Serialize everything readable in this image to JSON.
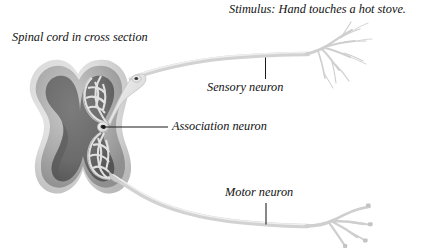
{
  "figure": {
    "kind": "anatomical-diagram",
    "background_color": "#ffffff",
    "width": 438,
    "height": 249
  },
  "labels": {
    "stimulus": "Stimulus: Hand touches a hot stove.",
    "spinal_cord": "Spinal cord in cross section",
    "sensory_neuron": "Sensory neuron",
    "association_neuron": "Association neuron",
    "motor_neuron": "Motor neuron"
  },
  "colors": {
    "text": "#111111",
    "leader_line": "#1a1a1a",
    "white_matter_outer": "#d9d9d9",
    "white_matter_mid": "#a9a9a9",
    "gray_matter": "#6e6e6e",
    "gray_matter_shadow": "#5d5d5d",
    "neuron_body": "#d6d6d6",
    "neuron_highlight": "#f1f1f1",
    "neuron_outline": "#bcbcbc",
    "ganglion_nucleus": "#3c3c3c",
    "axon": "#cfcfcf"
  },
  "structures": [
    {
      "name": "spinal-cord-cross-section",
      "description": "butterfly shaped gray matter within white matter"
    },
    {
      "name": "dorsal-root-ganglion",
      "description": "teardrop swelling with dark nucleus on sensory axon"
    },
    {
      "name": "sensory-neuron-cell-body",
      "description": "dendritic mesh in dorsal gray matter"
    },
    {
      "name": "association-neuron-soma",
      "description": "small round interneuron between sensory and motor"
    },
    {
      "name": "motor-neuron-cell-body",
      "description": "dendritic mesh in ventral gray matter"
    },
    {
      "name": "sensory-axon",
      "description": "axon from ganglion to skin receptor in hand"
    },
    {
      "name": "sensory-nerve-ending",
      "description": "fine branching free nerve endings"
    },
    {
      "name": "motor-axon",
      "description": "axon from ventral root to muscle"
    },
    {
      "name": "motor-end-plates",
      "description": "branched terminals ending in neuromuscular junctions"
    }
  ]
}
